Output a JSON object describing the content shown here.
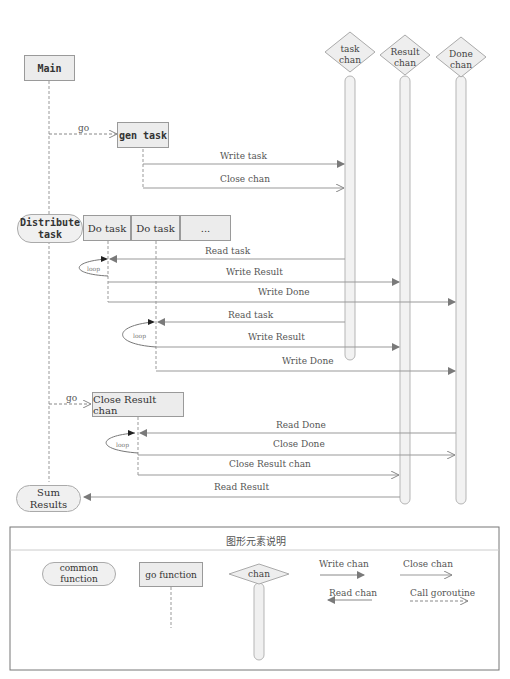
{
  "participants": {
    "main": "Main",
    "gen_task": "gen task",
    "distribute_task": "Distribute task",
    "do_task_1": "Do task",
    "do_task_2": "Do task",
    "do_task_more": "...",
    "close_result_chan": "Close Result chan",
    "sum_results": "Sum Results"
  },
  "channels": [
    {
      "line1": "task",
      "line2": "chan"
    },
    {
      "line1": "Result",
      "line2": "chan"
    },
    {
      "line1": "Done",
      "line2": "chan"
    }
  ],
  "messages": {
    "go_1": "go",
    "write_task": "Write task",
    "close_chan": "Close chan",
    "read_task_1": "Read task",
    "write_result_1": "Write Result",
    "write_done_1": "Write Done",
    "read_task_2": "Read task",
    "write_result_2": "Write Result",
    "write_done_2": "Write Done",
    "go_2": "go",
    "read_done": "Read Done",
    "close_done": "Close Done",
    "close_result_chan": "Close Result chan",
    "read_result": "Read Result",
    "loop_1": "loop",
    "loop_2": "loop",
    "loop_3": "loop"
  },
  "legend": {
    "title": "图形元素说明",
    "common_function": "common function",
    "go_function": "go function",
    "chan": "chan",
    "write_chan": "Write chan",
    "close_chan": "Close chan",
    "read_chan": "Read chan",
    "call_goroutine": "Call goroutine"
  },
  "colors": {
    "box_fill": "#ececec",
    "line": "#9a9a9a",
    "arrow_fill": "#808080",
    "chan_fill": "#eeeeee"
  }
}
